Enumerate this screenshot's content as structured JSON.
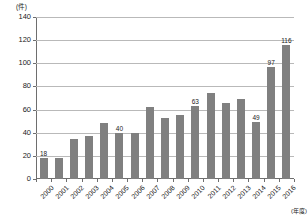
{
  "chart_data": {
    "type": "bar",
    "title": "",
    "xlabel": "(年度)",
    "ylabel": "(件)",
    "ylim": [
      0,
      140
    ],
    "yticks": [
      0,
      20,
      40,
      60,
      80,
      100,
      120,
      140
    ],
    "grid": true,
    "legend": "none",
    "categories": [
      "2000",
      "2001",
      "2002",
      "2003",
      "2004",
      "2005",
      "2006",
      "2007",
      "2008",
      "2009",
      "2010",
      "2011",
      "2012",
      "2013",
      "2014",
      "2015",
      "2016"
    ],
    "values": [
      18,
      18,
      35,
      37,
      48,
      40,
      40,
      62,
      53,
      55,
      63,
      74,
      66,
      69,
      49,
      97,
      116
    ],
    "point_labels": [
      "18",
      "",
      "",
      "",
      "",
      "40",
      "",
      "",
      "",
      "",
      "63",
      "",
      "",
      "",
      "49",
      "97",
      "116"
    ],
    "bar_color": "#808080",
    "grid_color": "#b9b9b9",
    "axis_color": "#6e6e6e",
    "background": "#ffffff"
  }
}
